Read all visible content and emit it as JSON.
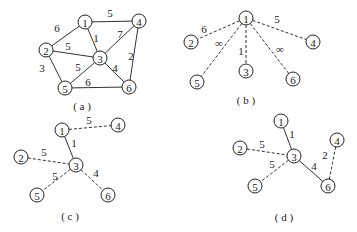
{
  "panels": [
    {
      "id": "a",
      "caption": "( a )",
      "caption_pos": [
        82,
        106
      ],
      "nodes": [
        {
          "id": "1",
          "x": 85,
          "y": 22
        },
        {
          "id": "2",
          "x": 46,
          "y": 50
        },
        {
          "id": "3",
          "x": 100,
          "y": 58
        },
        {
          "id": "4",
          "x": 139,
          "y": 21
        },
        {
          "id": "5",
          "x": 65,
          "y": 88
        },
        {
          "id": "6",
          "x": 129,
          "y": 87
        }
      ],
      "edges": [
        {
          "from": "1",
          "to": "2",
          "weight": "6",
          "style": "solid",
          "lx": 57,
          "ly": 28
        },
        {
          "from": "1",
          "to": "4",
          "weight": "5",
          "style": "solid",
          "lx": 110,
          "ly": 13
        },
        {
          "from": "1",
          "to": "3",
          "weight": "1",
          "style": "solid",
          "lx": 96,
          "ly": 38
        },
        {
          "from": "2",
          "to": "3",
          "weight": "5",
          "style": "solid",
          "lx": 68,
          "ly": 46
        },
        {
          "from": "2",
          "to": "5",
          "weight": "3",
          "style": "solid",
          "lx": 42,
          "ly": 68
        },
        {
          "from": "3",
          "to": "4",
          "weight": "7",
          "style": "solid",
          "lx": 120,
          "ly": 34
        },
        {
          "from": "3",
          "to": "5",
          "weight": "5",
          "style": "solid",
          "lx": 78,
          "ly": 67
        },
        {
          "from": "3",
          "to": "6",
          "weight": "4",
          "style": "solid",
          "lx": 115,
          "ly": 68
        },
        {
          "from": "4",
          "to": "6",
          "weight": "2",
          "style": "solid",
          "lx": 131,
          "ly": 56
        },
        {
          "from": "5",
          "to": "6",
          "weight": "6",
          "style": "solid",
          "lx": 88,
          "ly": 82
        }
      ]
    },
    {
      "id": "b",
      "caption": "( b )",
      "caption_pos": [
        246,
        100
      ],
      "nodes": [
        {
          "id": "1",
          "x": 246,
          "y": 18
        },
        {
          "id": "2",
          "x": 191,
          "y": 42
        },
        {
          "id": "3",
          "x": 246,
          "y": 71
        },
        {
          "id": "4",
          "x": 313,
          "y": 42
        },
        {
          "id": "5",
          "x": 197,
          "y": 82
        },
        {
          "id": "6",
          "x": 293,
          "y": 79
        }
      ],
      "edges": [
        {
          "from": "1",
          "to": "2",
          "weight": "6",
          "style": "dashed",
          "lx": 204,
          "ly": 29
        },
        {
          "from": "1",
          "to": "4",
          "weight": "5",
          "style": "dashed",
          "lx": 277,
          "ly": 19
        },
        {
          "from": "1",
          "to": "3",
          "weight": "1",
          "style": "dashed",
          "lx": 241,
          "ly": 51
        },
        {
          "from": "1",
          "to": "5",
          "weight": "∞",
          "style": "dashed",
          "lx": 219,
          "ly": 43
        },
        {
          "from": "1",
          "to": "6",
          "weight": "∞",
          "style": "dashed",
          "lx": 280,
          "ly": 49
        }
      ]
    },
    {
      "id": "c",
      "caption": "( c )",
      "caption_pos": [
        70,
        216
      ],
      "nodes": [
        {
          "id": "1",
          "x": 62,
          "y": 130
        },
        {
          "id": "2",
          "x": 21,
          "y": 157
        },
        {
          "id": "3",
          "x": 76,
          "y": 165
        },
        {
          "id": "4",
          "x": 118,
          "y": 125
        },
        {
          "id": "5",
          "x": 37,
          "y": 195
        },
        {
          "id": "6",
          "x": 108,
          "y": 195
        }
      ],
      "edges": [
        {
          "from": "1",
          "to": "4",
          "weight": "5",
          "style": "dashed",
          "lx": 89,
          "ly": 120
        },
        {
          "from": "1",
          "to": "3",
          "weight": "1",
          "style": "solid",
          "lx": 74,
          "ly": 143
        },
        {
          "from": "2",
          "to": "3",
          "weight": "5",
          "style": "dashed",
          "lx": 44,
          "ly": 152
        },
        {
          "from": "3",
          "to": "5",
          "weight": "5",
          "style": "dashed",
          "lx": 55,
          "ly": 176
        },
        {
          "from": "3",
          "to": "6",
          "weight": "4",
          "style": "dashed",
          "lx": 96,
          "ly": 173
        }
      ]
    },
    {
      "id": "d",
      "caption": "( d )",
      "caption_pos": [
        284,
        217
      ],
      "nodes": [
        {
          "id": "1",
          "x": 281,
          "y": 121
        },
        {
          "id": "2",
          "x": 240,
          "y": 148
        },
        {
          "id": "3",
          "x": 294,
          "y": 156
        },
        {
          "id": "4",
          "x": 337,
          "y": 140
        },
        {
          "id": "5",
          "x": 255,
          "y": 186
        },
        {
          "id": "6",
          "x": 328,
          "y": 186
        }
      ],
      "edges": [
        {
          "from": "1",
          "to": "3",
          "weight": "1",
          "style": "solid",
          "lx": 292,
          "ly": 134
        },
        {
          "from": "2",
          "to": "3",
          "weight": "5",
          "style": "dashed",
          "lx": 262,
          "ly": 144
        },
        {
          "from": "3",
          "to": "5",
          "weight": "5",
          "style": "dashed",
          "lx": 272,
          "ly": 164
        },
        {
          "from": "3",
          "to": "6",
          "weight": "4",
          "style": "solid",
          "lx": 314,
          "ly": 166
        },
        {
          "from": "4",
          "to": "6",
          "weight": "2",
          "style": "dashed",
          "lx": 325,
          "ly": 155
        }
      ]
    }
  ],
  "node_radius": 7
}
